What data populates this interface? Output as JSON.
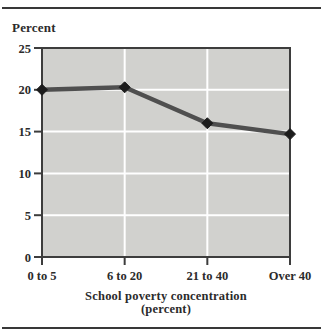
{
  "page": {
    "background": "#ffffff",
    "rule_color": "#383838"
  },
  "chart_data": {
    "type": "line",
    "title": "",
    "ylabel": "Percent",
    "xlabel_line1": "School poverty concentration",
    "xlabel_line2": "(percent)",
    "categories": [
      "0 to 5",
      "6 to 20",
      "21 to 40",
      "Over 40"
    ],
    "series": [
      {
        "name": "Percent",
        "values": [
          20,
          20.3,
          16,
          14.7
        ]
      }
    ],
    "ylim": [
      0,
      25
    ],
    "yticks": [
      0,
      5,
      10,
      15,
      20,
      25
    ],
    "grid": true,
    "legend": "none",
    "colors": {
      "plot_background": "#d1d1ce",
      "gridline": "#ffffff",
      "axis": "#3d3d3d",
      "line": "#4f4f4f",
      "marker": "#1c1c1c",
      "text": "#2b2b2b"
    }
  }
}
